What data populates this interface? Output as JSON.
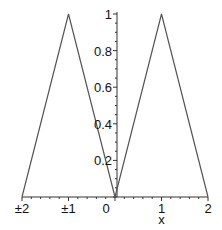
{
  "chart_data": {
    "type": "line",
    "title": "",
    "xlabel": "x",
    "ylabel": "",
    "xlim": [
      -2,
      2
    ],
    "ylim": [
      0,
      1
    ],
    "grid": false,
    "legend": null,
    "series": [
      {
        "name": "triangle-wave",
        "color": "#555555",
        "x": [
          -2,
          -1,
          0,
          1,
          2
        ],
        "y": [
          0,
          1,
          0,
          1,
          0
        ]
      }
    ],
    "x_ticks": [
      {
        "value": -2,
        "label": "±2"
      },
      {
        "value": -1,
        "label": "±1"
      },
      {
        "value": 0,
        "label": "0"
      },
      {
        "value": 1,
        "label": "1"
      },
      {
        "value": 2,
        "label": "2"
      }
    ],
    "y_ticks": [
      {
        "value": 0.2,
        "label": "0.2"
      },
      {
        "value": 0.4,
        "label": "0.4"
      },
      {
        "value": 0.6,
        "label": "0.6"
      },
      {
        "value": 0.8,
        "label": "0.8"
      },
      {
        "value": 1,
        "label": "1"
      }
    ],
    "axis_color": "#333333"
  }
}
